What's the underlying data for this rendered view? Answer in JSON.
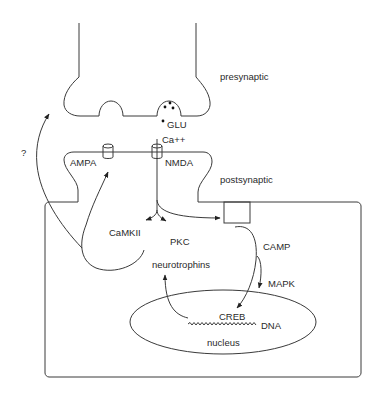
{
  "diagram": {
    "regions": {
      "presynaptic": "presynaptic",
      "postsynaptic": "postsynaptic",
      "nucleus": "nucleus"
    },
    "labels": {
      "glu": "GLU",
      "ca": "Ca++",
      "ampa": "AMPA",
      "nmda": "NMDA",
      "camkii": "CaMKII",
      "pkc": "PKC",
      "neurotrophins": "neurotrophins",
      "camp": "CAMP",
      "mapk": "MAPK",
      "creb": "CREB",
      "dna": "DNA",
      "question": "?"
    },
    "edges": [
      {
        "from": "NMDA",
        "to": "CaMKII"
      },
      {
        "from": "NMDA",
        "to": "PKC"
      },
      {
        "from": "NMDA",
        "to": "adenylyl-cyclase-box"
      },
      {
        "from": "adenylyl-cyclase-box",
        "to": "CREB",
        "via": "CAMP"
      },
      {
        "from": "CAMP",
        "to": "MAPK"
      },
      {
        "from": "DNA",
        "to": "neurotrophins"
      },
      {
        "from": "neurotrophins",
        "to": "AMPA"
      },
      {
        "from": "postsynaptic",
        "to": "presynaptic",
        "label": "?"
      }
    ],
    "colors": {
      "stroke": "#3a3a3a",
      "text": "#2a2a2a",
      "background": "#ffffff"
    }
  }
}
